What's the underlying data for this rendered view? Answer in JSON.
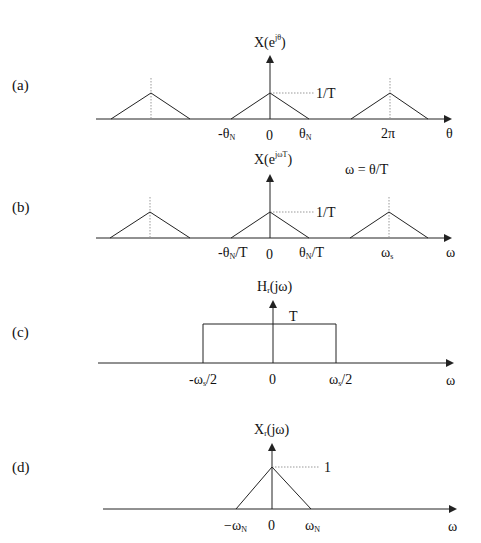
{
  "panels": [
    {
      "id": "a",
      "label": "(a)",
      "y_axis_label": {
        "base": "X(e",
        "sup": "jθ",
        "close": ")"
      },
      "x_axis_symbol": "θ",
      "peak_label": "1/T",
      "ticks": [
        {
          "main": "-θ",
          "sub": "N",
          "tail": ""
        },
        {
          "main": "0",
          "sub": "",
          "tail": ""
        },
        {
          "main": "θ",
          "sub": "N",
          "tail": ""
        },
        {
          "main": "2π",
          "sub": "",
          "tail": ""
        }
      ]
    },
    {
      "id": "b",
      "label": "(b)",
      "y_axis_label": {
        "base": "X(e",
        "sup": "jωT",
        "close": ")"
      },
      "x_axis_symbol": "ω",
      "peak_label": "1/T",
      "relation": "ω = θ/T",
      "ticks": [
        {
          "main": "-θ",
          "sub": "N",
          "tail": "/T"
        },
        {
          "main": "0",
          "sub": "",
          "tail": ""
        },
        {
          "main": "θ",
          "sub": "N",
          "tail": "/T"
        },
        {
          "main": "ω",
          "sub": "s",
          "tail": ""
        }
      ]
    },
    {
      "id": "c",
      "label": "(c)",
      "y_axis_label": {
        "base": "H",
        "sub": "r",
        "close": "(jω)"
      },
      "x_axis_symbol": "ω",
      "level_label": "T",
      "ticks": [
        {
          "main": "-ω",
          "sub": "s",
          "tail": "/2"
        },
        {
          "main": "0",
          "sub": "",
          "tail": ""
        },
        {
          "main": "ω",
          "sub": "s",
          "tail": "/2"
        }
      ]
    },
    {
      "id": "d",
      "label": "(d)",
      "y_axis_label": {
        "base": "X",
        "sub": "r",
        "close": "(jω)"
      },
      "x_axis_symbol": "ω",
      "peak_label": "1",
      "ticks": [
        {
          "main": "−ω",
          "sub": "N",
          "tail": ""
        },
        {
          "main": "0",
          "sub": "",
          "tail": ""
        },
        {
          "main": "ω",
          "sub": "N",
          "tail": ""
        }
      ]
    }
  ],
  "colors": {
    "line": "#222222",
    "dotted": "#888888",
    "background": "#ffffff"
  }
}
